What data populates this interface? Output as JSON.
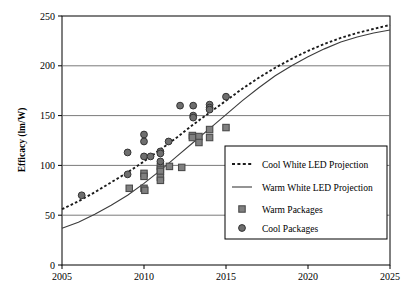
{
  "chart_data": {
    "type": "scatter",
    "title": "",
    "xlabel": "",
    "ylabel": "Efficacy (lm/W)",
    "xlim": [
      2005,
      2025
    ],
    "ylim": [
      0,
      250
    ],
    "xticks": [
      "2005",
      "2010",
      "2015",
      "2020",
      "2025"
    ],
    "yticks": [
      "0",
      "50",
      "100",
      "150",
      "200",
      "250"
    ],
    "grid": "horizontal",
    "legend_position": "lower-right-inside",
    "series": [
      {
        "name": "Cool White LED Projection",
        "type": "line",
        "style": "dotted",
        "color": "#1a1a1a",
        "points": [
          [
            2005,
            56
          ],
          [
            2006,
            64
          ],
          [
            2007,
            73
          ],
          [
            2008,
            83
          ],
          [
            2009,
            93
          ],
          [
            2010,
            104
          ],
          [
            2011,
            116
          ],
          [
            2012,
            128
          ],
          [
            2013,
            141
          ],
          [
            2014,
            153
          ],
          [
            2015,
            165
          ],
          [
            2016,
            177
          ],
          [
            2017,
            188
          ],
          [
            2018,
            198
          ],
          [
            2019,
            207
          ],
          [
            2020,
            215
          ],
          [
            2021,
            222
          ],
          [
            2022,
            228
          ],
          [
            2023,
            233
          ],
          [
            2024,
            237
          ],
          [
            2025,
            241
          ]
        ]
      },
      {
        "name": "Warm White LED Projection",
        "type": "line",
        "style": "solid",
        "color": "#3c3c3c",
        "points": [
          [
            2005,
            37
          ],
          [
            2006,
            43
          ],
          [
            2007,
            51
          ],
          [
            2008,
            60
          ],
          [
            2009,
            70
          ],
          [
            2010,
            82
          ],
          [
            2011,
            95
          ],
          [
            2012,
            109
          ],
          [
            2013,
            123
          ],
          [
            2014,
            137
          ],
          [
            2015,
            151
          ],
          [
            2016,
            165
          ],
          [
            2017,
            178
          ],
          [
            2018,
            190
          ],
          [
            2019,
            200
          ],
          [
            2020,
            209
          ],
          [
            2021,
            217
          ],
          [
            2022,
            224
          ],
          [
            2023,
            229
          ],
          [
            2024,
            233
          ],
          [
            2025,
            236
          ]
        ]
      },
      {
        "name": "Warm Packages",
        "type": "scatter",
        "marker": "square",
        "color": "#808080",
        "edge": "#4a4a4a",
        "points": [
          [
            2009.1,
            77
          ],
          [
            2010.0,
            92
          ],
          [
            2010.0,
            89
          ],
          [
            2010.0,
            77
          ],
          [
            2010.05,
            75
          ],
          [
            2011.0,
            99
          ],
          [
            2011.0,
            96
          ],
          [
            2011.0,
            94
          ],
          [
            2011.0,
            88
          ],
          [
            2011.0,
            85
          ],
          [
            2011.55,
            99
          ],
          [
            2012.3,
            98
          ],
          [
            2012.95,
            130
          ],
          [
            2012.95,
            128
          ],
          [
            2013.35,
            129
          ],
          [
            2013.35,
            123
          ],
          [
            2014.0,
            136
          ],
          [
            2014.0,
            128
          ],
          [
            2015.0,
            138
          ]
        ]
      },
      {
        "name": "Cool Packages",
        "type": "scatter",
        "marker": "circle",
        "color": "#6e6e6e",
        "edge": "#333333",
        "points": [
          [
            2006.2,
            70
          ],
          [
            2009.0,
            113
          ],
          [
            2009.0,
            91
          ],
          [
            2010.0,
            131
          ],
          [
            2010.0,
            124
          ],
          [
            2010.0,
            109
          ],
          [
            2010.4,
            109
          ],
          [
            2011.0,
            114
          ],
          [
            2011.0,
            112
          ],
          [
            2011.0,
            104
          ],
          [
            2011.5,
            124
          ],
          [
            2012.2,
            160
          ],
          [
            2013.0,
            160
          ],
          [
            2013.0,
            150
          ],
          [
            2013.0,
            148
          ],
          [
            2014.0,
            161
          ],
          [
            2014.0,
            158
          ],
          [
            2014.0,
            156
          ],
          [
            2015.0,
            169
          ]
        ]
      }
    ]
  },
  "legend": {
    "entries": [
      {
        "label": "Cool White LED Projection",
        "glyph": "dotted-line-swatch"
      },
      {
        "label": "Warm White LED Projection",
        "glyph": "solid-line-swatch"
      },
      {
        "label": "Warm Packages",
        "glyph": "square-marker-swatch"
      },
      {
        "label": "Cool Packages",
        "glyph": "circle-marker-swatch"
      }
    ]
  },
  "colors": {
    "axis": "#000000",
    "grid": "#6b6b6b",
    "cool_line": "#1a1a1a",
    "warm_line": "#3c3c3c",
    "warm_marker": "#808080",
    "cool_marker": "#6e6e6e",
    "background": "#ffffff"
  }
}
